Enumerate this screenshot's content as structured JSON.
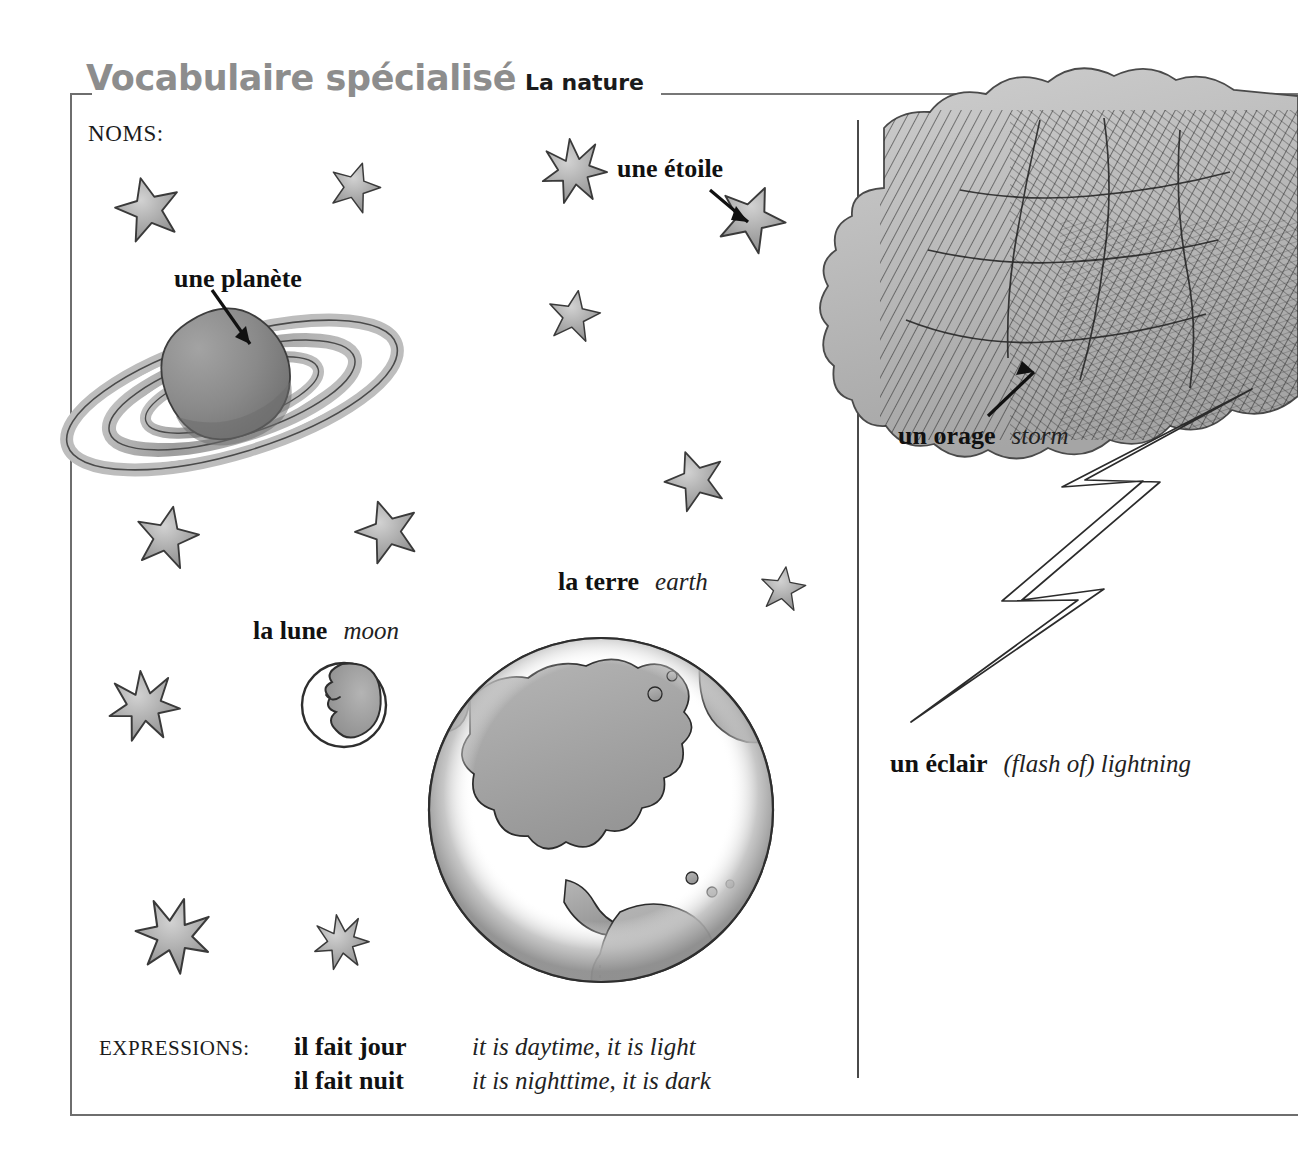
{
  "header": {
    "title_main": "Vocabulaire spécialisé",
    "title_sub": "La nature"
  },
  "sections": {
    "nouns_label": "NOMS:",
    "expressions_label": "EXPRESSIONS:"
  },
  "vocabulary": {
    "etoile": {
      "french": "une étoile",
      "english": ""
    },
    "planete": {
      "french": "une planète",
      "english": ""
    },
    "lune": {
      "french": "la lune",
      "english": "moon"
    },
    "terre": {
      "french": "la terre",
      "english": "earth"
    },
    "orage": {
      "french": "un orage",
      "english": "storm"
    },
    "eclair": {
      "french": "un éclair",
      "english": "(flash of) lightning"
    }
  },
  "expressions": [
    {
      "french": "il fait jour",
      "english": "it is daytime, it is light"
    },
    {
      "french": "il fait nuit",
      "english": "it is nighttime, it is dark"
    }
  ],
  "illustrations": {
    "planet": "saturn-planet-illustration",
    "moon": "crescent-moon-face-illustration",
    "earth": "earth-globe-americas-illustration",
    "storm_cloud": "storm-cloud-illustration",
    "lightning": "lightning-bolt-illustration",
    "stars": "star-illustration"
  },
  "colors": {
    "title_gray": "#8d8d8d",
    "rule_gray": "#777777",
    "frame_gray": "#6e6e6e",
    "ink_black": "#111111",
    "wash_gray": "#9a9a9a"
  }
}
